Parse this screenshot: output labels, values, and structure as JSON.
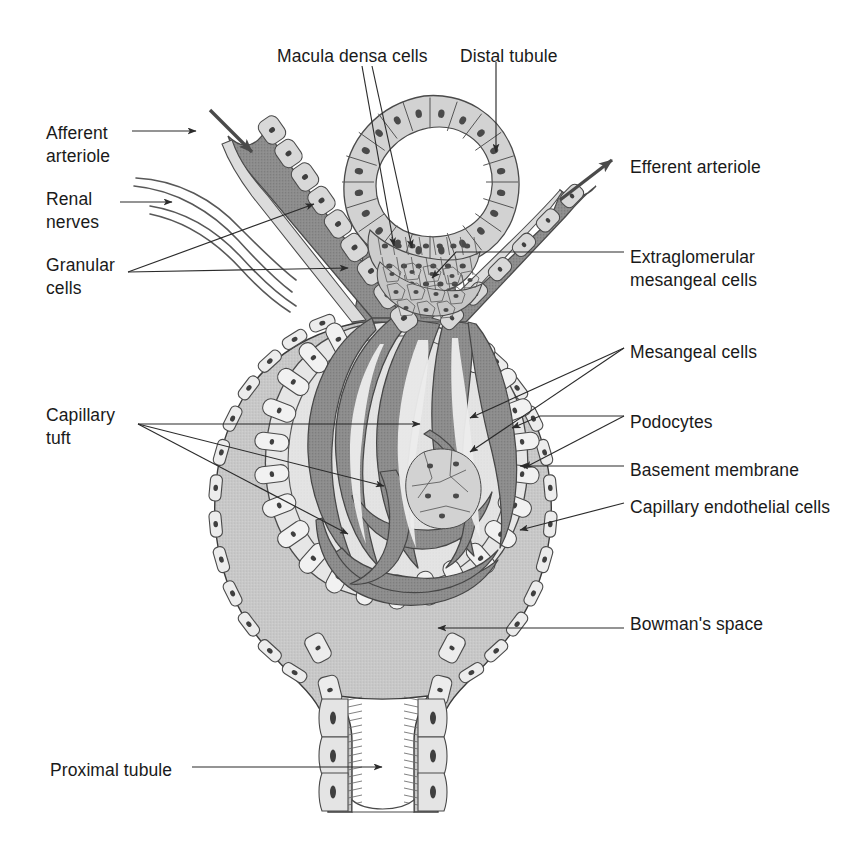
{
  "figure": {
    "background_color": "#ffffff",
    "ink_color": "#1a1a1a"
  },
  "palette": {
    "line": "#3b3b3b",
    "capsule_cell_fill": "#e9e9e9",
    "bowmans_space_fill": "#c9c9c9",
    "capillary_fill": "#8d8d8d",
    "capillary_lumen_fill": "#e2e2e2",
    "arteriole_fill": "#8a8a8a",
    "tubule_cell_fill": "#cfcfcf",
    "nucleus_fill": "#4a4a4a",
    "mesangial_fill": "#c4c4c4"
  },
  "labels": [
    {
      "id": "afferent-arteriole",
      "text": "Afferent\narteriole",
      "x": 46,
      "y": 122,
      "align": "left"
    },
    {
      "id": "renal-nerves",
      "text": "Renal\nnerves",
      "x": 46,
      "y": 188,
      "align": "left"
    },
    {
      "id": "granular-cells",
      "text": "Granular\ncells",
      "x": 46,
      "y": 254,
      "align": "left"
    },
    {
      "id": "capillary-tuft",
      "text": "Capillary\ntuft",
      "x": 46,
      "y": 404,
      "align": "left"
    },
    {
      "id": "proximal-tubule",
      "text": "Proximal tubule",
      "x": 50,
      "y": 759,
      "align": "left"
    },
    {
      "id": "macula-densa-cells",
      "text": "Macula densa cells",
      "x": 277,
      "y": 45,
      "align": "left"
    },
    {
      "id": "distal-tubule",
      "text": "Distal tubule",
      "x": 460,
      "y": 45,
      "align": "left"
    },
    {
      "id": "efferent-arteriole",
      "text": "Efferent arteriole",
      "x": 630,
      "y": 156,
      "align": "left"
    },
    {
      "id": "extraglomerular-mesangeal-cells",
      "text": "Extraglomerular\nmesangeal cells",
      "x": 630,
      "y": 246,
      "align": "left"
    },
    {
      "id": "mesangeal-cells",
      "text": "Mesangeal cells",
      "x": 630,
      "y": 341,
      "align": "left"
    },
    {
      "id": "podocytes",
      "text": "Podocytes",
      "x": 630,
      "y": 411,
      "align": "left"
    },
    {
      "id": "basement-membrane",
      "text": "Basement membrane",
      "x": 630,
      "y": 459,
      "align": "left"
    },
    {
      "id": "capillary-endothelial-cells",
      "text": "Capillary endothelial cells",
      "x": 630,
      "y": 496,
      "align": "left"
    },
    {
      "id": "bowmans-space",
      "text": "Bowman's space",
      "x": 630,
      "y": 613,
      "align": "left"
    }
  ],
  "structures": [
    {
      "id": "bowmans-capsule",
      "name": "Bowman's capsule"
    },
    {
      "id": "bowmans-space",
      "name": "Bowman's space"
    },
    {
      "id": "glomerular-capillary-tuft",
      "name": "Glomerular capillary tuft"
    },
    {
      "id": "podocyte-layer",
      "name": "Podocyte layer"
    },
    {
      "id": "basement-membrane-layer",
      "name": "Basement membrane"
    },
    {
      "id": "afferent-arteriole-vessel",
      "name": "Afferent arteriole"
    },
    {
      "id": "efferent-arteriole-vessel",
      "name": "Efferent arteriole"
    },
    {
      "id": "distal-tubule-ring",
      "name": "Distal tubule"
    },
    {
      "id": "macula-densa-patch",
      "name": "Macula densa cells"
    },
    {
      "id": "extraglomerular-mesangium",
      "name": "Extraglomerular mesangeal cells"
    },
    {
      "id": "granular-cell-group",
      "name": "Granular cells"
    },
    {
      "id": "renal-nerve-fibers",
      "name": "Renal nerves"
    },
    {
      "id": "proximal-tubule-neck",
      "name": "Proximal tubule"
    }
  ]
}
